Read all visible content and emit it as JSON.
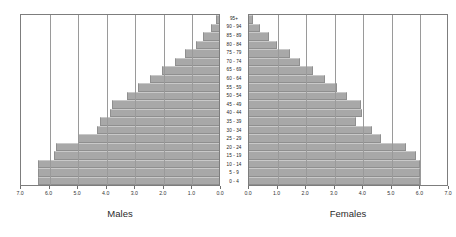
{
  "chart_data": {
    "type": "bar",
    "title": "",
    "subtitle": "",
    "xlabel": "",
    "ylabel": "",
    "orientation": "horizontal",
    "layout": "population-pyramid",
    "grid": true,
    "legend_position": "below-axes",
    "xlim": [
      0,
      7
    ],
    "xtick_step": 1,
    "axis_unit": "percent",
    "categories": [
      "95+",
      "90 - 94",
      "85 - 89",
      "80 - 84",
      "75 - 79",
      "70 - 74",
      "65 - 69",
      "60 - 64",
      "55 - 59",
      "50 - 54",
      "45 - 49",
      "40 - 44",
      "35 - 39",
      "30 - 34",
      "25 - 29",
      "20 - 24",
      "15 - 19",
      "10 - 14",
      "5 -  9",
      "0 -  4"
    ],
    "series": [
      {
        "name": "Males",
        "side": "left",
        "axis_ticks": [
          "7.0",
          "6.0",
          "5.0",
          "4.0",
          "3.0",
          "2.0",
          "1.0",
          "0.0"
        ],
        "values": [
          0.1,
          0.3,
          0.55,
          0.8,
          1.2,
          1.55,
          2.0,
          2.45,
          2.85,
          3.25,
          3.8,
          3.85,
          4.2,
          4.3,
          5.0,
          5.75,
          5.85,
          6.4,
          6.4,
          6.4
        ]
      },
      {
        "name": "Females",
        "side": "right",
        "axis_ticks": [
          "0.0",
          "1.0",
          "2.0",
          "3.0",
          "4.0",
          "5.0",
          "6.0",
          "7.0"
        ],
        "values": [
          0.15,
          0.4,
          0.7,
          1.0,
          1.45,
          1.8,
          2.25,
          2.7,
          3.1,
          3.45,
          3.95,
          4.0,
          3.8,
          4.35,
          4.65,
          5.55,
          5.9,
          6.05,
          6.05,
          6.05
        ]
      }
    ],
    "colors": {
      "bar_fill": "#a8a8a8",
      "bar_stroke": "#8f8f8f",
      "gridline": "#9a9a9a",
      "axis_frame": "#7d7d7d",
      "text": "#2b2b2b",
      "background": "#ffffff"
    }
  }
}
